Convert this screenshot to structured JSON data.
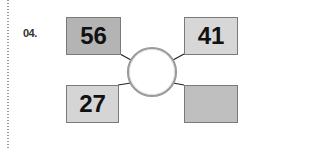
{
  "question": {
    "number": "04."
  },
  "diagram": {
    "center_circle": {
      "value": ""
    },
    "boxes": [
      {
        "position": "top-left",
        "value": "56",
        "color": "#b4b4b4"
      },
      {
        "position": "top-right",
        "value": "41",
        "color": "#d7d7d7"
      },
      {
        "position": "bottom-left",
        "value": "27",
        "color": "#d5d5d5"
      },
      {
        "position": "bottom-right",
        "value": "",
        "color": "#bfbfbf"
      }
    ]
  }
}
